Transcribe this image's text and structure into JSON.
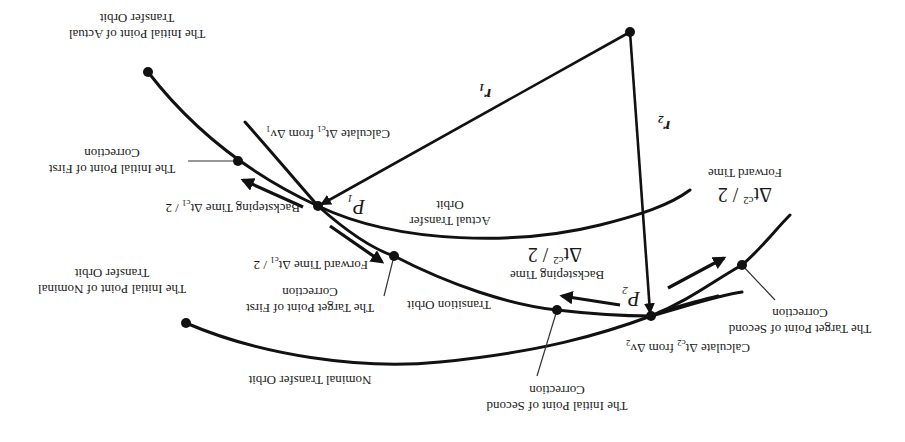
{
  "diagram": {
    "orientation": "rotated 180 degrees",
    "labels": {
      "initial_actual": [
        "The Initial Point of Actual",
        "Transfer Orbit"
      ],
      "initial_first_corr": [
        "The Initial Point of First",
        "Correction"
      ],
      "backstep_1": "Backsteping  Time  Δt",
      "backstep_1_sub": "c1",
      "backstep_1_tail": " / 2",
      "forward_1": "Forward Time Δt",
      "forward_1_sub": "c1",
      "forward_1_tail": " / 2",
      "target_first_corr": [
        "The Target Point of First",
        "Correction"
      ],
      "initial_nominal": [
        "The Initial Point of Nominal",
        "Transfer Orbit"
      ],
      "nominal_orbit": "Nominal Transfer Orbit",
      "calc_1": "Calculate Δt",
      "calc_1_sub": "c1",
      "calc_1_tail": " from Δv",
      "calc_1_tail_sub": "1",
      "actual_orbit": [
        "Actual Transfer",
        "Orbit"
      ],
      "P1": "P",
      "P1_sub": "1",
      "r1": "r",
      "r1_sub": "1",
      "r2": "r",
      "r2_sub": "2",
      "P2": "P",
      "P2_sub": "2",
      "transition_orbit": "Transition Orbit",
      "backstep_2_title": "Backsteping Time",
      "backstep_2_val": "Δt",
      "backstep_2_sub": "c2",
      "backstep_2_tail": " / 2",
      "forward_2_title": "Forward Time",
      "forward_2_val": "Δt",
      "forward_2_sub": "c2",
      "forward_2_tail": " / 2",
      "initial_second_corr": [
        "The Initial Point of Second",
        "Correction"
      ],
      "target_second_corr": [
        "The Target Point of Second",
        "Correction"
      ],
      "calc_2": "Calculate Δt",
      "calc_2_sub": "c2",
      "calc_2_tail": " from Δv",
      "calc_2_tail_sub": "2"
    },
    "colors": {
      "ink": "#111111",
      "background": "#ffffff"
    }
  }
}
